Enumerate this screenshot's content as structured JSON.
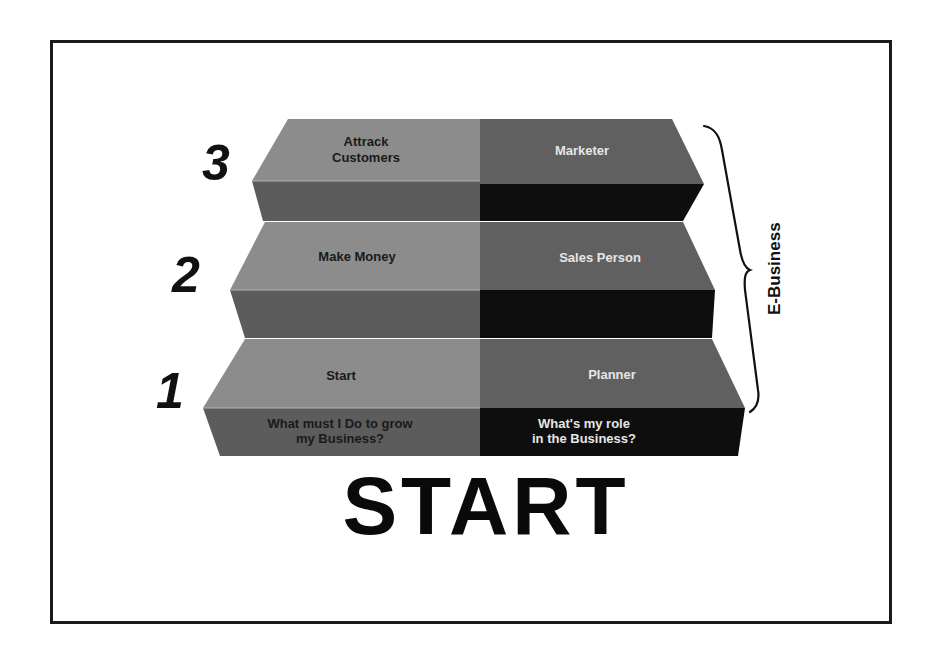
{
  "diagram": {
    "title": "START",
    "brace_label": "E-Business",
    "colors": {
      "left_top": "#8c8c8c",
      "left_front": "#5c5c5c",
      "right_top": "#606060",
      "right_front": "#0e0e0e",
      "left_text": "#1a1a1a",
      "right_text": "#e6e6e6"
    },
    "steps": [
      {
        "number": "1",
        "left_top_label": "Start",
        "right_top_label": "Planner",
        "left_front_label_line1": "What must I Do to grow",
        "left_front_label_line2": "my Business?",
        "right_front_label_line1": "What's my role",
        "right_front_label_line2": "in the Business?"
      },
      {
        "number": "2",
        "left_top_label": "Make Money",
        "right_top_label": "Sales Person"
      },
      {
        "number": "3",
        "left_top_label_line1": "Attrack",
        "left_top_label_line2": "Customers",
        "right_top_label": "Marketer"
      }
    ]
  }
}
